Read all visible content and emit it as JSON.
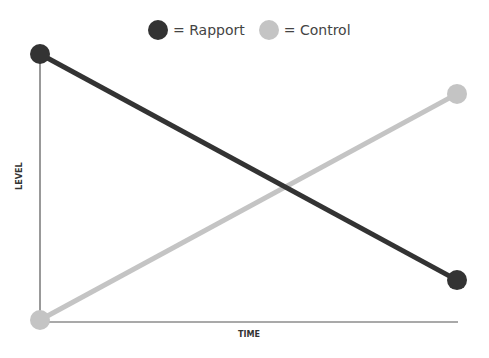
{
  "chart_data": {
    "type": "line",
    "title": "",
    "xlabel": "TIME",
    "ylabel": "LEVEL",
    "x": [
      "start",
      "end"
    ],
    "series": [
      {
        "name": "Rapport",
        "values": [
          1,
          0.15
        ],
        "color": "#333333"
      },
      {
        "name": "Control",
        "values": [
          0,
          0.85
        ],
        "color": "#c4c4c4"
      }
    ],
    "ylim": [
      0,
      1
    ],
    "grid": false,
    "legend_position": "top",
    "tick_labels": false
  },
  "legend": {
    "items": [
      {
        "label": "= Rapport",
        "color": "#333333"
      },
      {
        "label": "= Control",
        "color": "#c4c4c4"
      }
    ]
  },
  "axes": {
    "x_label": "TIME",
    "y_label": "LEVEL"
  }
}
